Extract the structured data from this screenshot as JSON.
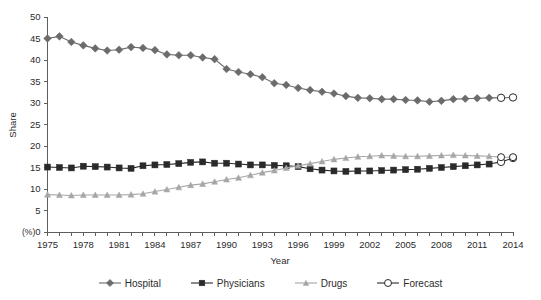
{
  "chart_data": {
    "type": "line",
    "title": "",
    "xlabel": "Year",
    "ylabel": "Share",
    "yunit": "(%)",
    "xlim": [
      1975,
      2014
    ],
    "ylim": [
      0,
      50
    ],
    "ytick_step": 5,
    "yticks": [
      "0",
      "5",
      "10",
      "15",
      "20",
      "25",
      "30",
      "35",
      "40",
      "45",
      "50"
    ],
    "xticks_labeled": [
      "1975",
      "1978",
      "1981",
      "1984",
      "1987",
      "1990",
      "1993",
      "1996",
      "1999",
      "2002",
      "2005",
      "2008",
      "2011",
      "2014"
    ],
    "xtick_step_minor": 1,
    "xtick_step_labeled": 3,
    "grid": false,
    "legend_position": "bottom-center",
    "x": [
      1975,
      1976,
      1977,
      1978,
      1979,
      1980,
      1981,
      1982,
      1983,
      1984,
      1985,
      1986,
      1987,
      1988,
      1989,
      1990,
      1991,
      1992,
      1993,
      1994,
      1995,
      1996,
      1997,
      1998,
      1999,
      2000,
      2001,
      2002,
      2003,
      2004,
      2005,
      2006,
      2007,
      2008,
      2009,
      2010,
      2011,
      2012,
      2013,
      2014
    ],
    "forecast_years": [
      2013,
      2014
    ],
    "last_actual_year": 2012,
    "series": [
      {
        "name": "Hospital",
        "color": "#6b6b6b",
        "marker": "diamond",
        "values": [
          45.0,
          45.5,
          44.2,
          43.4,
          42.7,
          42.2,
          42.4,
          43.0,
          42.8,
          42.3,
          41.3,
          41.1,
          41.1,
          40.6,
          40.2,
          37.9,
          37.2,
          36.7,
          36.0,
          34.6,
          34.2,
          33.5,
          33.0,
          32.6,
          32.2,
          31.6,
          31.2,
          31.1,
          30.9,
          30.9,
          30.7,
          30.6,
          30.3,
          30.5,
          30.9,
          31.0,
          31.1,
          31.2,
          31.2,
          31.3
        ]
      },
      {
        "name": "Physicians",
        "color": "#2a2a2a",
        "marker": "square",
        "values": [
          15.1,
          15.0,
          14.9,
          15.3,
          15.2,
          15.1,
          14.9,
          14.8,
          15.4,
          15.6,
          15.7,
          15.9,
          16.2,
          16.3,
          16.0,
          16.0,
          15.8,
          15.6,
          15.6,
          15.5,
          15.4,
          15.2,
          14.7,
          14.4,
          14.2,
          14.1,
          14.2,
          14.2,
          14.3,
          14.4,
          14.5,
          14.6,
          14.8,
          15.0,
          15.2,
          15.4,
          15.6,
          15.8,
          16.3,
          17.2
        ]
      },
      {
        "name": "Drugs",
        "color": "#a6a6a6",
        "marker": "triangle",
        "values": [
          8.7,
          8.6,
          8.5,
          8.6,
          8.6,
          8.6,
          8.6,
          8.7,
          8.9,
          9.4,
          9.9,
          10.4,
          10.9,
          11.2,
          11.7,
          12.2,
          12.6,
          13.2,
          13.8,
          14.3,
          14.9,
          15.4,
          15.9,
          16.4,
          16.9,
          17.2,
          17.5,
          17.6,
          17.8,
          17.7,
          17.6,
          17.6,
          17.7,
          17.8,
          17.9,
          17.8,
          17.7,
          17.6,
          17.4,
          17.4
        ]
      }
    ],
    "forecast_marker": {
      "name": "Forecast",
      "marker": "open-circle",
      "color": "#2a2a2a",
      "fill": "#ffffff"
    }
  },
  "legend": {
    "items": [
      {
        "label": "Hospital",
        "marker": "diamond",
        "color": "#6b6b6b"
      },
      {
        "label": "Physicians",
        "marker": "square",
        "color": "#2a2a2a"
      },
      {
        "label": "Drugs",
        "marker": "triangle",
        "color": "#a6a6a6"
      },
      {
        "label": "Forecast",
        "marker": "open-circle",
        "color": "#2a2a2a"
      }
    ]
  }
}
